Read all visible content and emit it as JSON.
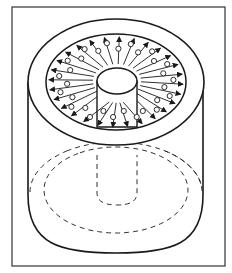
{
  "figure": {
    "colors": {
      "background": "#ffffff",
      "line": "#1a1a1a",
      "frame": "#333333"
    },
    "frame": {
      "x": 12,
      "y": 7,
      "width": 213,
      "height": 259
    },
    "cylinder": {
      "center_x": 116,
      "top_center_y": 82,
      "outer_rx": 88,
      "outer_ry": 63,
      "ring_rx": 70,
      "ring_ry": 48,
      "wall_left_x": 28,
      "wall_right_x": 203,
      "wall_bottom_y": 195,
      "base_bottom_y": 253
    },
    "post": {
      "cx": 117,
      "cy": 81,
      "rx": 20,
      "ry": 13,
      "side_bottom_y": 127
    },
    "hidden": {
      "outer_dashed": {
        "cx": 116,
        "cy": 192,
        "rx": 86,
        "ry": 50
      },
      "inner_dashed": {
        "cx": 116,
        "cy": 190,
        "rx": 72,
        "ry": 43
      },
      "post_dashed": {
        "left_x": 97,
        "right_x": 137,
        "top_y": 155,
        "straight_bottom_y": 193,
        "u_bottom_y": 205
      }
    },
    "flow": {
      "arrow_count": 28,
      "particle_count": 30,
      "arrow_direction": "radially outward"
    }
  }
}
